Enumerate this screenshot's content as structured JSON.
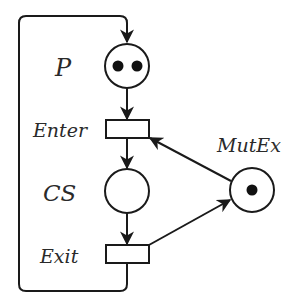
{
  "diagram": {
    "type": "petri-net",
    "colors": {
      "stroke": "#1a1a1a",
      "token": "#111111",
      "text": "#2a2a2a",
      "background": "#ffffff"
    },
    "places": [
      {
        "id": "P",
        "label": "P",
        "tokens": 2
      },
      {
        "id": "CS",
        "label": "CS",
        "tokens": 0
      },
      {
        "id": "MutEx",
        "label": "MutEx",
        "tokens": 1
      }
    ],
    "transitions": [
      {
        "id": "Enter",
        "label": "Enter"
      },
      {
        "id": "Exit",
        "label": "Exit"
      }
    ],
    "arcs": [
      {
        "from": "P",
        "to": "Enter"
      },
      {
        "from": "Enter",
        "to": "CS"
      },
      {
        "from": "CS",
        "to": "Exit"
      },
      {
        "from": "Exit",
        "to": "P"
      },
      {
        "from": "MutEx",
        "to": "Enter"
      },
      {
        "from": "Exit",
        "to": "MutEx"
      }
    ]
  },
  "labels": {
    "p": "P",
    "enter": "Enter",
    "cs": "CS",
    "exit": "Exit",
    "mutex": "MutEx"
  }
}
